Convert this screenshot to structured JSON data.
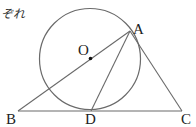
{
  "header_fragment": {
    "text": "ぞれ"
  },
  "diagram": {
    "stroke_color": "#666666",
    "label_color": "#222222",
    "circle": {
      "center_label": "O",
      "cx": 90,
      "cy": 59,
      "r": 50
    },
    "points": {
      "A": {
        "label": "A",
        "x": 130,
        "y": 31
      },
      "B": {
        "label": "B",
        "x": 18,
        "y": 110
      },
      "C": {
        "label": "C",
        "x": 182,
        "y": 110
      },
      "D": {
        "label": "D",
        "x": 91,
        "y": 110
      },
      "O": {
        "label": "O",
        "x": 90,
        "y": 59
      }
    },
    "segments": [
      "BA",
      "AD",
      "AC",
      "BC"
    ]
  }
}
